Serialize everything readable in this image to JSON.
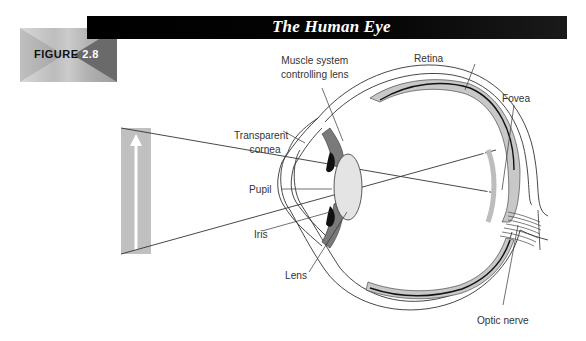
{
  "figure": {
    "badge_word": "FIGURE",
    "badge_number": "2.8",
    "title": "The Human Eye"
  },
  "labels": {
    "muscle_line1": "Muscle system",
    "muscle_line2": "controlling lens",
    "retina": "Retina",
    "fovea": "Fovea",
    "cornea_line1": "Transparent",
    "cornea_line2": "cornea",
    "pupil": "Pupil",
    "iris": "Iris",
    "lens": "Lens",
    "optic_nerve": "Optic nerve"
  },
  "colors": {
    "title_bar": "#000000",
    "title_text": "#ffffff",
    "retina_fill": "#c8c8c8",
    "muscle_fill": "#7a7a7a",
    "lens_fill": "#e4e4e4",
    "iris_fill": "#111111",
    "object_fill": "#c0c0c0",
    "line": "#333333"
  }
}
